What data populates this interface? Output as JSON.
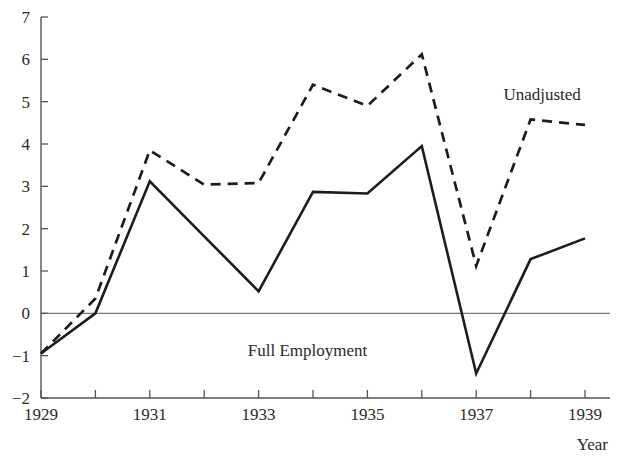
{
  "chart_data": {
    "type": "line",
    "title": "",
    "xlabel": "Year",
    "ylabel": "",
    "xlim": [
      1929,
      1939
    ],
    "ylim": [
      -2,
      7
    ],
    "grid": false,
    "legend_position": "inline-annotation",
    "x": [
      1929,
      1930,
      1931,
      1932,
      1933,
      1934,
      1935,
      1936,
      1937,
      1938,
      1939
    ],
    "x_tick_values": [
      1929,
      1930,
      1931,
      1932,
      1933,
      1934,
      1935,
      1936,
      1937,
      1938,
      1939
    ],
    "x_tick_labels": [
      "1929",
      "",
      "1931",
      "",
      "1933",
      "",
      "1935",
      "",
      "1937",
      "",
      "1939"
    ],
    "y_tick_values": [
      -2,
      -1,
      0,
      1,
      2,
      3,
      4,
      5,
      6,
      7
    ],
    "y_tick_labels": [
      "−2",
      "−1",
      "0",
      "1",
      "2",
      "3",
      "4",
      "5",
      "6",
      "7"
    ],
    "series": [
      {
        "name": "Unadjusted",
        "style": "dashed",
        "color": "#1d1d1d",
        "values": [
          -0.95,
          0.35,
          3.85,
          3.04,
          3.08,
          5.4,
          4.9,
          6.12,
          1.12,
          4.58,
          4.45
        ]
      },
      {
        "name": "Full Employment",
        "style": "solid",
        "color": "#1d1d1d",
        "values": [
          -0.95,
          0.0,
          3.12,
          1.82,
          0.52,
          2.87,
          2.83,
          3.95,
          -1.42,
          1.28,
          1.77
        ]
      }
    ],
    "annotations": [
      {
        "text": "Unadjusted",
        "x": 1937.5,
        "y": 5.05,
        "anchor": "start"
      },
      {
        "text": "Full Employment",
        "x": 1933.9,
        "y": -1.0,
        "anchor": "middle"
      }
    ]
  },
  "axis": {
    "x_title": "Year",
    "zero_reference": "0"
  }
}
